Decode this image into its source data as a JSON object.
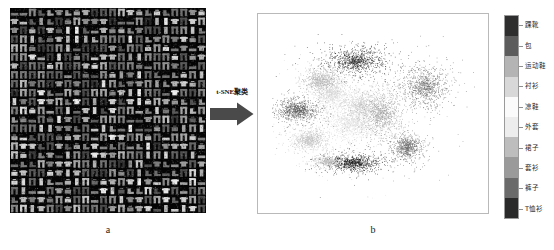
{
  "figure": {
    "panel_a": {
      "caption": "a",
      "description": "Fashion-MNIST sample image grid"
    },
    "panel_b": {
      "caption": "b",
      "description": "t-SNE two-dimensional embedding scatter plot"
    },
    "arrow": {
      "label": "t-SNE聚类",
      "icon": "right-arrow-icon"
    }
  },
  "legend": {
    "orientation": "vertical",
    "items": [
      {
        "label": "踝靴",
        "color": "#2e2e2e"
      },
      {
        "label": "包",
        "color": "#5c5c5c"
      },
      {
        "label": "运动鞋",
        "color": "#b4b4b4"
      },
      {
        "label": "衬衫",
        "color": "#d8d8d8"
      },
      {
        "label": "凉鞋",
        "color": "#fbfbfb"
      },
      {
        "label": "外套",
        "color": "#ededed"
      },
      {
        "label": "裙子",
        "color": "#bdbdbd"
      },
      {
        "label": "套衫",
        "color": "#9a9a9a"
      },
      {
        "label": "裤子",
        "color": "#6a6a6a"
      },
      {
        "label": "T恤衫",
        "color": "#2a2a2a"
      }
    ]
  },
  "chart_data": {
    "type": "scatter",
    "title": "",
    "xlabel": "",
    "ylabel": "",
    "grid": false,
    "axes_visible": false,
    "legend_position": "right",
    "categories": [
      "踝靴",
      "包",
      "运动鞋",
      "衬衫",
      "凉鞋",
      "外套",
      "裙子",
      "套衫",
      "裤子",
      "T恤衫"
    ],
    "category_colors": [
      "#2e2e2e",
      "#5c5c5c",
      "#b4b4b4",
      "#d8d8d8",
      "#fbfbfb",
      "#ededed",
      "#bdbdbd",
      "#9a9a9a",
      "#6a6a6a",
      "#2a2a2a"
    ],
    "xlim": [
      0,
      1
    ],
    "ylim": [
      0,
      1
    ],
    "clusters": [
      {
        "name": "踝靴",
        "color": "#2a2a2a",
        "cx": 0.415,
        "cy": 0.2,
        "rx": 0.145,
        "ry": 0.075,
        "n": 900
      },
      {
        "name": "包",
        "color": "#707070",
        "cx": 0.755,
        "cy": 0.345,
        "rx": 0.11,
        "ry": 0.115,
        "n": 900
      },
      {
        "name": "运动鞋",
        "color": "#b4b4b4",
        "cx": 0.245,
        "cy": 0.315,
        "rx": 0.085,
        "ry": 0.07,
        "n": 800
      },
      {
        "name": "衬衫",
        "color": "#cfcfcf",
        "cx": 0.44,
        "cy": 0.455,
        "rx": 0.14,
        "ry": 0.11,
        "n": 900
      },
      {
        "name": "凉鞋",
        "color": "#dcdcdc",
        "cx": 0.395,
        "cy": 0.56,
        "rx": 0.12,
        "ry": 0.095,
        "n": 800
      },
      {
        "name": "外套",
        "color": "#9e9e9e",
        "cx": 0.54,
        "cy": 0.5,
        "rx": 0.1,
        "ry": 0.12,
        "n": 850
      },
      {
        "name": "裙子",
        "color": "#c4c4c4",
        "cx": 0.185,
        "cy": 0.65,
        "rx": 0.08,
        "ry": 0.055,
        "n": 700
      },
      {
        "name": "套衫",
        "color": "#5e5e5e",
        "cx": 0.125,
        "cy": 0.48,
        "rx": 0.105,
        "ry": 0.06,
        "n": 850
      },
      {
        "name": "裤子",
        "color": "#6e6e6e",
        "cx": 0.665,
        "cy": 0.69,
        "rx": 0.075,
        "ry": 0.07,
        "n": 700
      },
      {
        "name": "T恤衫",
        "color": "#242424",
        "cx": 0.4,
        "cy": 0.78,
        "rx": 0.12,
        "ry": 0.045,
        "n": 850
      },
      {
        "name": "裙子2",
        "color": "#bfbfbf",
        "cx": 0.275,
        "cy": 0.775,
        "rx": 0.065,
        "ry": 0.035,
        "n": 380
      },
      {
        "name": "衬衫2",
        "color": "#dadada",
        "cx": 0.3,
        "cy": 0.39,
        "rx": 0.075,
        "ry": 0.06,
        "n": 520
      }
    ]
  }
}
